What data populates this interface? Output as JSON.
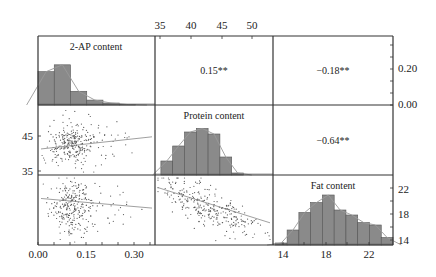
{
  "chart_data": {
    "type": "scatter-matrix",
    "title": "",
    "variables": [
      "2-AP content",
      "Protein content",
      "Fat content"
    ],
    "axes": {
      "2-AP content": {
        "range": [
          0.0,
          0.36
        ],
        "ticks": [
          "0.00",
          "0.15",
          "0.30"
        ],
        "right_ticks": [
          "0.00",
          "0.20"
        ]
      },
      "Protein content": {
        "range": [
          33,
          53
        ],
        "ticks": [
          "35",
          "40",
          "45",
          "50"
        ],
        "left_ticks": [
          "35",
          "45"
        ]
      },
      "Fat content": {
        "range": [
          13.3,
          23.5
        ],
        "ticks": [
          "14",
          "18",
          "22"
        ],
        "right_ticks": [
          "14",
          "18",
          "22"
        ]
      }
    },
    "correlations": [
      {
        "pair": [
          "2-AP content",
          "Protein content"
        ],
        "r": "0.15**"
      },
      {
        "pair": [
          "2-AP content",
          "Fat content"
        ],
        "r": "-0.18**"
      },
      {
        "pair": [
          "Protein content",
          "Fat content"
        ],
        "r": "-0.64**"
      }
    ],
    "histograms": [
      {
        "variable": "2-AP content",
        "bins": [
          0.025,
          0.075,
          0.125,
          0.175,
          0.225,
          0.275,
          0.325
        ],
        "heights": [
          0.68,
          0.82,
          0.28,
          0.1,
          0.04,
          0.01
        ]
      },
      {
        "variable": "Protein content",
        "bins": [
          35,
          37,
          39,
          41,
          43,
          45,
          47,
          49,
          51
        ],
        "heights": [
          0.28,
          0.58,
          0.86,
          0.93,
          0.82,
          0.36,
          0.04
        ]
      },
      {
        "variable": "Fat content",
        "bins": [
          14,
          15,
          16,
          17,
          18,
          19,
          20,
          21,
          22,
          23
        ],
        "heights": [
          0.04,
          0.3,
          0.65,
          0.85,
          1.0,
          0.7,
          0.6,
          0.45,
          0.4,
          0.15
        ]
      }
    ],
    "regression_trends": [
      {
        "x": "2-AP content",
        "y": "Protein content",
        "slope": "positive"
      },
      {
        "x": "2-AP content",
        "y": "Fat content",
        "slope": "slightly negative"
      },
      {
        "x": "Protein content",
        "y": "Fat content",
        "slope": "negative"
      }
    ],
    "grid": false,
    "legend": "none"
  },
  "labels": {
    "diag_2ap": "2-AP content",
    "diag_protein": "Protein content",
    "diag_fat": "Fat content",
    "r_12": "0.15**",
    "r_13": "−0.18**",
    "r_23": "−0.64**",
    "top_ticks": [
      "35",
      "40",
      "45",
      "50"
    ],
    "right_ticks_row1": [
      "0.20",
      "0.00"
    ],
    "left_ticks_row2": [
      "45",
      "35"
    ],
    "right_ticks_row3": [
      "22",
      "18",
      "14"
    ],
    "bottom_ticks_col1": [
      "0.00",
      "0.15",
      "0.30"
    ],
    "bottom_ticks_col3": [
      "14",
      "18",
      "22"
    ]
  },
  "colors": {
    "bar": "#8a8a8a",
    "bar_edge": "#555555",
    "frame": "#333333",
    "point": "#555555",
    "line": "#888888"
  }
}
